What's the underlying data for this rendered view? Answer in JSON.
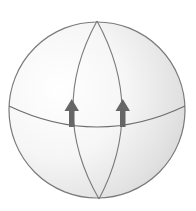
{
  "diagram": {
    "title": "",
    "colors": {
      "background": "#ffffff",
      "sphere_light": "#fbfbfb",
      "sphere_shadow": "#d4d4d4",
      "line": "#7a7a7a",
      "arrow": "#666666"
    },
    "elements": [
      {
        "id": "sphere",
        "type": "sphere-outline"
      },
      {
        "id": "equator",
        "type": "great-circle"
      },
      {
        "id": "meridian-left",
        "type": "great-circle"
      },
      {
        "id": "meridian-right",
        "type": "great-circle"
      },
      {
        "id": "arrow-left",
        "type": "arrow",
        "direction": "north"
      },
      {
        "id": "arrow-right",
        "type": "arrow",
        "direction": "north"
      }
    ],
    "labels": []
  }
}
